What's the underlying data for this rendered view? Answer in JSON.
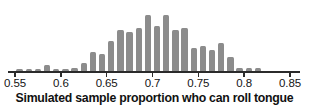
{
  "chart_data": {
    "type": "bar",
    "title": "",
    "xlabel": "Simulated sample proportion who can roll tongue",
    "ylabel": "",
    "grid": false,
    "legend": null,
    "xlim": [
      0.55,
      0.85
    ],
    "ylim": [
      0,
      30
    ],
    "bar_color": "#8c8c8c",
    "axis_color": "#2b2b2b",
    "tick_labels": [
      "0.55",
      "0.6",
      "0.65",
      "0.7",
      "0.75",
      "0.8",
      "0.85"
    ],
    "tick_values": [
      0.55,
      0.6,
      0.65,
      0.7,
      0.75,
      0.8,
      0.85
    ],
    "bin_width": 0.01,
    "categories": [
      "0.555",
      "0.565",
      "0.575",
      "0.585",
      "0.595",
      "0.605",
      "0.615",
      "0.625",
      "0.635",
      "0.645",
      "0.655",
      "0.665",
      "0.675",
      "0.685",
      "0.695",
      "0.705",
      "0.715",
      "0.725",
      "0.735",
      "0.745",
      "0.755",
      "0.765",
      "0.775",
      "0.785",
      "0.795",
      "0.805",
      "0.815"
    ],
    "values": [
      1,
      1,
      1,
      3,
      1,
      1,
      2,
      4,
      9,
      8,
      14,
      19,
      18,
      20,
      26,
      21,
      26,
      19,
      20,
      11,
      12,
      10,
      13,
      7,
      2,
      2,
      2
    ]
  },
  "axis": {
    "title": "Simulated sample proportion who can roll tongue"
  }
}
